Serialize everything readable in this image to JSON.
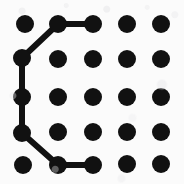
{
  "figure": {
    "width": 184,
    "height": 184,
    "background_color": "#fbfbfb",
    "dot_color": "#111111",
    "line_color": "#111111",
    "dot_radius": 9,
    "line_width": 6
  },
  "grid": {
    "rows": 5,
    "columns": 5,
    "column_x": [
      23,
      58,
      93,
      127,
      161
    ],
    "row_y": [
      24,
      58,
      97,
      133,
      165
    ],
    "dots": [
      {
        "id": "r1c1",
        "row": 1,
        "col": 1,
        "x": 25,
        "y": 24,
        "selected": true
      },
      {
        "id": "r1c2",
        "row": 1,
        "col": 2,
        "x": 58,
        "y": 24,
        "selected": true
      },
      {
        "id": "r1c3",
        "row": 1,
        "col": 3,
        "x": 93,
        "y": 24,
        "selected": true
      },
      {
        "id": "r1c4",
        "row": 1,
        "col": 4,
        "x": 127,
        "y": 24,
        "selected": false
      },
      {
        "id": "r1c5",
        "row": 1,
        "col": 5,
        "x": 161,
        "y": 24,
        "selected": false
      },
      {
        "id": "r2c1",
        "row": 2,
        "col": 1,
        "x": 22,
        "y": 58,
        "selected": true
      },
      {
        "id": "r2c2",
        "row": 2,
        "col": 2,
        "x": 58,
        "y": 59,
        "selected": false
      },
      {
        "id": "r2c3",
        "row": 2,
        "col": 3,
        "x": 93,
        "y": 59,
        "selected": false
      },
      {
        "id": "r2c4",
        "row": 2,
        "col": 4,
        "x": 127,
        "y": 59,
        "selected": false
      },
      {
        "id": "r2c5",
        "row": 2,
        "col": 5,
        "x": 161,
        "y": 59,
        "selected": false
      },
      {
        "id": "r3c1",
        "row": 3,
        "col": 1,
        "x": 22,
        "y": 97,
        "selected": true
      },
      {
        "id": "r3c2",
        "row": 3,
        "col": 2,
        "x": 58,
        "y": 97,
        "selected": false
      },
      {
        "id": "r3c3",
        "row": 3,
        "col": 3,
        "x": 93,
        "y": 97,
        "selected": false
      },
      {
        "id": "r3c4",
        "row": 3,
        "col": 4,
        "x": 127,
        "y": 97,
        "selected": false
      },
      {
        "id": "r3c5",
        "row": 3,
        "col": 5,
        "x": 161,
        "y": 97,
        "selected": false
      },
      {
        "id": "r4c1",
        "row": 4,
        "col": 1,
        "x": 22,
        "y": 133,
        "selected": true
      },
      {
        "id": "r4c2",
        "row": 4,
        "col": 2,
        "x": 58,
        "y": 132,
        "selected": false
      },
      {
        "id": "r4c3",
        "row": 4,
        "col": 3,
        "x": 93,
        "y": 132,
        "selected": false
      },
      {
        "id": "r4c4",
        "row": 4,
        "col": 4,
        "x": 127,
        "y": 132,
        "selected": false
      },
      {
        "id": "r4c5",
        "row": 4,
        "col": 5,
        "x": 161,
        "y": 132,
        "selected": false
      },
      {
        "id": "r5c1",
        "row": 5,
        "col": 1,
        "x": 23,
        "y": 165,
        "selected": false
      },
      {
        "id": "r5c2",
        "row": 5,
        "col": 2,
        "x": 58,
        "y": 165,
        "selected": true
      },
      {
        "id": "r5c3",
        "row": 5,
        "col": 3,
        "x": 93,
        "y": 165,
        "selected": true
      },
      {
        "id": "r5c4",
        "row": 5,
        "col": 4,
        "x": 127,
        "y": 164,
        "selected": false
      },
      {
        "id": "r5c5",
        "row": 5,
        "col": 5,
        "x": 161,
        "y": 164,
        "selected": false
      }
    ]
  },
  "path": {
    "shape_label": "C",
    "node_order": [
      "r1c3",
      "r1c2",
      "r2c1",
      "r3c1",
      "r4c1",
      "r5c2",
      "r5c3"
    ],
    "segments": [
      {
        "id": "seg-1",
        "from": "r1c3",
        "to": "r1c2",
        "x1": 93,
        "y1": 24,
        "x2": 58,
        "y2": 24,
        "kind": "horizontal"
      },
      {
        "id": "seg-2",
        "from": "r1c2",
        "to": "r2c1",
        "x1": 58,
        "y1": 24,
        "x2": 22,
        "y2": 58,
        "kind": "diagonal"
      },
      {
        "id": "seg-3",
        "from": "r2c1",
        "to": "r3c1",
        "x1": 22,
        "y1": 58,
        "x2": 22,
        "y2": 97,
        "kind": "vertical"
      },
      {
        "id": "seg-4",
        "from": "r3c1",
        "to": "r4c1",
        "x1": 22,
        "y1": 97,
        "x2": 22,
        "y2": 133,
        "kind": "vertical"
      },
      {
        "id": "seg-5",
        "from": "r4c1",
        "to": "r5c2",
        "x1": 22,
        "y1": 133,
        "x2": 58,
        "y2": 165,
        "kind": "diagonal"
      },
      {
        "id": "seg-6",
        "from": "r5c2",
        "to": "r5c3",
        "x1": 58,
        "y1": 165,
        "x2": 93,
        "y2": 165,
        "kind": "horizontal"
      }
    ]
  }
}
